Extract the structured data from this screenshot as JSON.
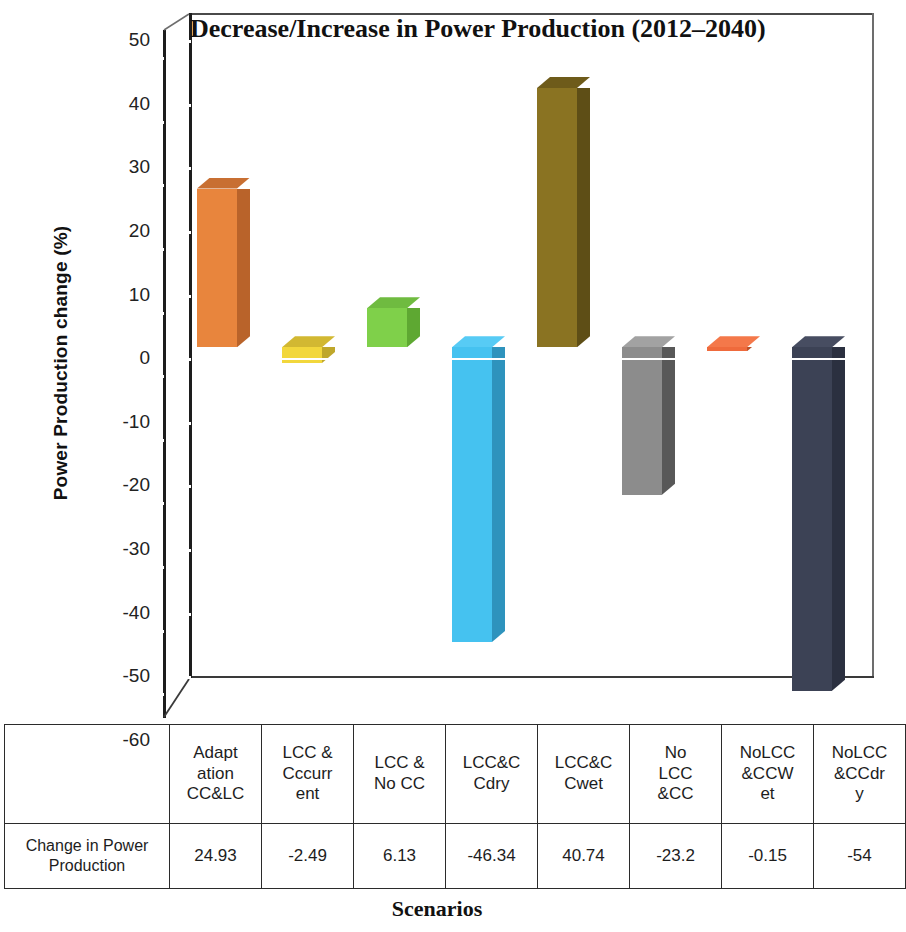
{
  "chart_data": {
    "type": "bar",
    "title": "Decrease/Increase in Power Production (2012–2040)",
    "xlabel": "Scenarios",
    "ylabel": "Power Production change (%)",
    "ylim": [
      -60,
      50
    ],
    "ytick_step": 10,
    "yticks": [
      "50",
      "40",
      "30",
      "20",
      "10",
      "0",
      "-10",
      "-20",
      "-30",
      "-40",
      "-50",
      "-60"
    ],
    "grid": false,
    "legend": "none",
    "three_d": true,
    "categories": [
      "Adaptation CC&LC",
      "LCC & Cccurrent",
      "LCC & No CC",
      "LCC&CCdry",
      "LCC&CCwet",
      "No LCC &CC",
      "NoLCC&CCWet",
      "NoLCC&CCdry"
    ],
    "category_lines": [
      [
        "Adapt",
        "ation",
        "CC&LC"
      ],
      [
        "LCC &",
        "Cccurr",
        "ent"
      ],
      [
        "LCC &",
        "No CC"
      ],
      [
        "LCC&C",
        "Cdry"
      ],
      [
        "LCC&C",
        "Cwet"
      ],
      [
        "No",
        "LCC",
        "&CC"
      ],
      [
        "NoLCC",
        "&CCW",
        "et"
      ],
      [
        "NoLCC",
        "&CCdr",
        "y"
      ]
    ],
    "values": [
      24.93,
      -2.49,
      6.13,
      -46.34,
      40.74,
      -23.2,
      -0.15,
      -54
    ],
    "value_labels": [
      "24.93",
      "-2.49",
      "6.13",
      "-46.34",
      "40.74",
      "-23.2",
      "-0.15",
      "-54"
    ],
    "colors": [
      "#e8853d",
      "#f2d73c",
      "#7fd04a",
      "#45c2f0",
      "#8a7322",
      "#8c8c8c",
      "#ef6a3c",
      "#3c4255"
    ],
    "side_colors": [
      "#b9632a",
      "#bfa72b",
      "#5ea832",
      "#2e93bd",
      "#5e4e16",
      "#585858",
      "#bb5129",
      "#2b3040"
    ],
    "top_colors": [
      "#c86f32",
      "#d2b832",
      "#6fbb40",
      "#57cbf5",
      "#6e5b1a",
      "#a2a2a2",
      "#f4784a",
      "#474d61"
    ],
    "series_name": "Change in Power Production"
  },
  "table": {
    "row_header": "Change in Power Production"
  }
}
